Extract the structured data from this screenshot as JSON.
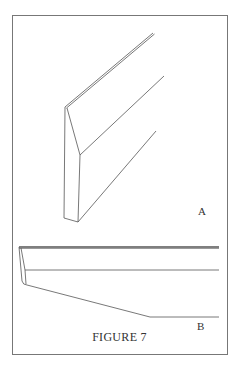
{
  "figure": {
    "caption": "FIGURE 7",
    "parts": [
      {
        "id": "A",
        "label": "A",
        "description": "Beveled board, perspective view"
      },
      {
        "id": "B",
        "label": "B",
        "description": "Beveled board, side view"
      }
    ]
  },
  "colors": {
    "line": "#555555",
    "frame": "#777777",
    "background": "#ffffff"
  }
}
